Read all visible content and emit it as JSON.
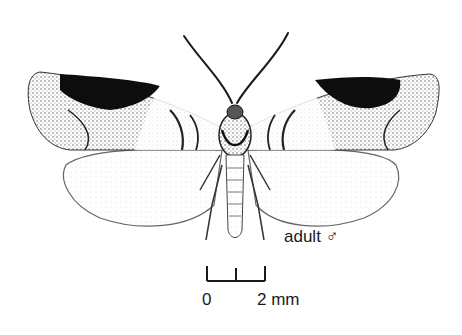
{
  "figure": {
    "caption": "adult ♂",
    "scale_bar": {
      "start_label": "0",
      "end_label": "2 mm",
      "ticks": 3
    },
    "colors": {
      "ink": "#1a1a1a",
      "background": "#ffffff",
      "forewing_dark": "#0d0d0d",
      "forewing_mid": "#8a8a8a",
      "hindwing": "#f4f4f4"
    }
  }
}
